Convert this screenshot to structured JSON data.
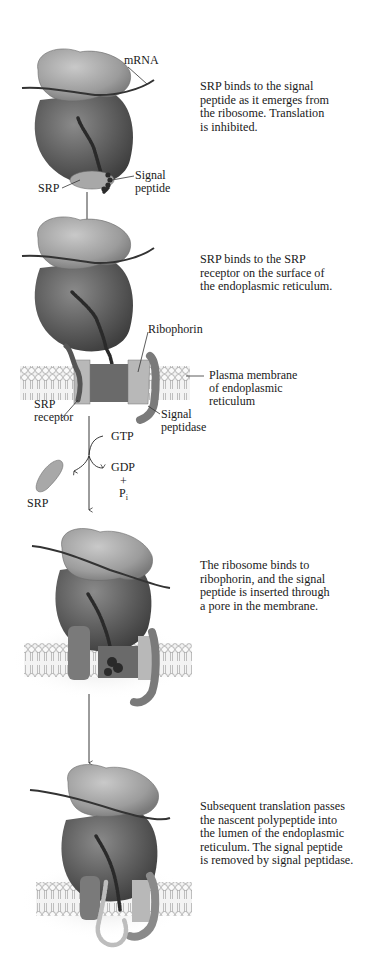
{
  "figure": {
    "steps": [
      {
        "id": 1,
        "caption_lines": [
          "SRP binds to the signal",
          "peptide as it emerges from",
          "the ribosome. Translation",
          "is inhibited."
        ],
        "labels": {
          "mrna": "mRNA",
          "srp": "SRP",
          "signal_peptide_1": "Signal",
          "signal_peptide_2": "peptide"
        }
      },
      {
        "id": 2,
        "caption_lines": [
          "SRP binds to the SRP",
          "receptor on the surface of",
          "the endoplasmic reticulum."
        ],
        "labels": {
          "ribophorin": "Ribophorin",
          "membrane_1": "Plasma membrane",
          "membrane_2": "of endoplasmic",
          "membrane_3": "reticulum",
          "srp_receptor_1": "SRP",
          "srp_receptor_2": "receptor",
          "signal_peptidase_1": "Signal",
          "signal_peptidase_2": "peptidase"
        }
      },
      {
        "id": "transition",
        "labels": {
          "gtp": "GTP",
          "gdp": "GDP",
          "plus": "+",
          "pi": "P",
          "pi_sub": "i",
          "srp_released": "SRP"
        }
      },
      {
        "id": 3,
        "caption_lines": [
          "The ribosome binds to",
          "ribophorin, and the signal",
          "peptide is inserted through",
          "a pore in the membrane."
        ]
      },
      {
        "id": 4,
        "caption_lines": [
          "Subsequent translation passes",
          "the nascent polypeptide into",
          "the lumen of the endoplasmic",
          "reticulum. The signal peptide",
          "is removed by signal peptidase."
        ]
      }
    ],
    "colors": {
      "ribosome_large": "#5e5e5e",
      "ribosome_small": "#9a9a9a",
      "srp": "#a8a8a8",
      "peptide": "#2a2a2a",
      "membrane": "#dcdcdc",
      "text": "#1a1a1a"
    }
  }
}
